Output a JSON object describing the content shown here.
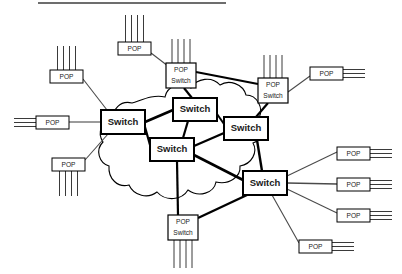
{
  "page": {
    "background_color": "#ffffff",
    "width": 402,
    "height": 274
  },
  "header_rule": {
    "name": "top-divider-rule",
    "x1": 38,
    "y1": 3,
    "x2": 226,
    "y2": 3,
    "color": "#6d6d6d"
  },
  "colors": {
    "box_fill": "#ffffff",
    "box_stroke": "#000000",
    "core_link": "#000000",
    "access_link": "#4a4a4a",
    "cloud_stroke": "#000000",
    "label_text": "#1a1a1a"
  },
  "legend_terms": {
    "switch": "Switch",
    "pop": "POP",
    "pop_switch_line1": "POP",
    "pop_switch_line2": "Switch"
  },
  "cloud": {
    "name": "network-cloud-outline",
    "d": "M 132 103 C 120 100 112 110 113 120 C 101 121 97 133 103 142 C 95 150 99 163 109 166 C 108 179 118 188 129 185 C 134 196 148 199 157 192 C 166 202 182 200 188 190 C 199 198 214 193 216 182 C 229 185 241 177 240 166 C 252 164 258 152 253 143 C 264 139 267 126 259 118 C 264 108 257 95 246 95 C 243 84 229 79 220 85 C 212 76 197 78 191 88 C 181 81 167 86 165 97 C 152 94 140 101 132 103 Z"
  },
  "nodes": [
    {
      "id": "sw-west",
      "name": "switch-west",
      "type": "switch",
      "label": "Switch",
      "x": 101,
      "y": 110,
      "w": 44,
      "h": 24,
      "stroke": 2.0,
      "font": 9.5
    },
    {
      "id": "sw-north",
      "name": "switch-north",
      "type": "switch",
      "label": "Switch",
      "x": 173,
      "y": 98,
      "w": 44,
      "h": 23,
      "stroke": 2.0,
      "font": 9.5
    },
    {
      "id": "sw-center",
      "name": "switch-center",
      "type": "switch",
      "label": "Switch",
      "x": 150,
      "y": 138,
      "w": 44,
      "h": 23,
      "stroke": 2.0,
      "font": 9.5
    },
    {
      "id": "sw-east",
      "name": "switch-east",
      "type": "switch",
      "label": "Switch",
      "x": 224,
      "y": 117,
      "w": 44,
      "h": 23,
      "stroke": 2.0,
      "font": 9.5
    },
    {
      "id": "sw-southeast",
      "name": "switch-southeast",
      "type": "switch",
      "label": "Switch",
      "x": 243,
      "y": 171,
      "w": 44,
      "h": 24,
      "stroke": 2.0,
      "font": 9.5
    },
    {
      "id": "popsw-north",
      "name": "pop-switch-north",
      "type": "popswitch",
      "label": "POP Switch",
      "x": 166,
      "y": 63,
      "w": 30,
      "h": 25,
      "stroke": 1.2,
      "font": 6.6
    },
    {
      "id": "popsw-east",
      "name": "pop-switch-east",
      "type": "popswitch",
      "label": "POP Switch",
      "x": 258,
      "y": 78,
      "w": 30,
      "h": 25,
      "stroke": 1.2,
      "font": 6.6
    },
    {
      "id": "popsw-south",
      "name": "pop-switch-south",
      "type": "popswitch",
      "label": "POP Switch",
      "x": 168,
      "y": 215,
      "w": 30,
      "h": 25,
      "stroke": 1.2,
      "font": 6.6
    },
    {
      "id": "pop-nw",
      "name": "pop-northwest",
      "type": "pop",
      "label": "POP",
      "x": 50,
      "y": 70,
      "w": 33,
      "h": 13,
      "stroke": 1.0,
      "font": 6.6
    },
    {
      "id": "pop-w",
      "name": "pop-west",
      "type": "pop",
      "label": "POP",
      "x": 36,
      "y": 116,
      "w": 33,
      "h": 13,
      "stroke": 1.0,
      "font": 6.6
    },
    {
      "id": "pop-sw",
      "name": "pop-southwest",
      "type": "pop",
      "label": "POP",
      "x": 52,
      "y": 158,
      "w": 33,
      "h": 13,
      "stroke": 1.0,
      "font": 6.6
    },
    {
      "id": "pop-n",
      "name": "pop-north",
      "type": "pop",
      "label": "POP",
      "x": 118,
      "y": 42,
      "w": 33,
      "h": 13,
      "stroke": 1.0,
      "font": 6.6
    },
    {
      "id": "pop-ne",
      "name": "pop-northeast",
      "type": "pop",
      "label": "POP",
      "x": 310,
      "y": 67,
      "w": 33,
      "h": 13,
      "stroke": 1.0,
      "font": 6.6
    },
    {
      "id": "pop-e1",
      "name": "pop-east-1",
      "type": "pop",
      "label": "POP",
      "x": 337,
      "y": 147,
      "w": 33,
      "h": 13,
      "stroke": 1.0,
      "font": 6.6
    },
    {
      "id": "pop-e2",
      "name": "pop-east-2",
      "type": "pop",
      "label": "POP",
      "x": 337,
      "y": 178,
      "w": 33,
      "h": 13,
      "stroke": 1.0,
      "font": 6.6
    },
    {
      "id": "pop-e3",
      "name": "pop-east-3",
      "type": "pop",
      "label": "POP",
      "x": 337,
      "y": 209,
      "w": 33,
      "h": 13,
      "stroke": 1.0,
      "font": 6.6
    },
    {
      "id": "pop-se",
      "name": "pop-southeast",
      "type": "pop",
      "label": "POP",
      "x": 299,
      "y": 240,
      "w": 33,
      "h": 13,
      "stroke": 1.0,
      "font": 6.6
    }
  ],
  "core_links": [
    {
      "name": "link-switch-west-to-switch-north",
      "x1": 145,
      "y1": 122,
      "x2": 173,
      "y2": 110,
      "w": 2.6
    },
    {
      "name": "link-switch-west-to-switch-center",
      "x1": 145,
      "y1": 127,
      "x2": 150,
      "y2": 145,
      "w": 2.2
    },
    {
      "name": "link-switch-north-to-popswitch-north",
      "x1": 192,
      "y1": 98,
      "x2": 184,
      "y2": 88,
      "w": 2.2
    },
    {
      "name": "link-switch-north-to-switch-center",
      "x1": 188,
      "y1": 121,
      "x2": 183,
      "y2": 138,
      "w": 2.2
    },
    {
      "name": "link-switch-north-to-switch-east",
      "x1": 217,
      "y1": 114,
      "x2": 224,
      "y2": 124,
      "w": 2.0
    },
    {
      "name": "link-switch-center-to-switch-east",
      "x1": 194,
      "y1": 146,
      "x2": 224,
      "y2": 133,
      "w": 2.4
    },
    {
      "name": "link-switch-center-to-switch-southeast",
      "x1": 194,
      "y1": 155,
      "x2": 243,
      "y2": 180,
      "w": 2.6
    },
    {
      "name": "link-switch-center-to-popswitch-south",
      "x1": 177,
      "y1": 161,
      "x2": 178,
      "y2": 215,
      "w": 2.2
    },
    {
      "name": "link-switch-east-to-switch-southeast",
      "x1": 257,
      "y1": 140,
      "x2": 262,
      "y2": 171,
      "w": 2.4
    },
    {
      "name": "link-switch-east-to-popswitch-east",
      "x1": 256,
      "y1": 117,
      "x2": 268,
      "y2": 103,
      "w": 2.2
    },
    {
      "name": "link-popswitch-north-to-popswitch-east",
      "x1": 196,
      "y1": 72,
      "x2": 258,
      "y2": 84,
      "w": 2.2
    },
    {
      "name": "link-popswitch-south-to-switch-southeast",
      "x1": 198,
      "y1": 218,
      "x2": 247,
      "y2": 195,
      "w": 2.4
    }
  ],
  "access_links": [
    {
      "name": "link-pop-northwest-to-switch-west",
      "x1": 83,
      "y1": 79,
      "x2": 107,
      "y2": 110,
      "w": 1.1
    },
    {
      "name": "link-pop-west-to-switch-west",
      "x1": 69,
      "y1": 122,
      "x2": 101,
      "y2": 122,
      "w": 1.1
    },
    {
      "name": "link-pop-southwest-to-switch-west",
      "x1": 85,
      "y1": 160,
      "x2": 108,
      "y2": 134,
      "w": 1.1
    },
    {
      "name": "link-pop-north-to-popswitch-north",
      "x1": 151,
      "y1": 53,
      "x2": 168,
      "y2": 66,
      "w": 1.1
    },
    {
      "name": "link-pop-northeast-to-popswitch-east",
      "x1": 310,
      "y1": 76,
      "x2": 288,
      "y2": 92,
      "w": 1.1
    },
    {
      "name": "link-pop-east-1-to-switch-southeast",
      "x1": 337,
      "y1": 152,
      "x2": 287,
      "y2": 176,
      "w": 1.1
    },
    {
      "name": "link-pop-east-2-to-switch-southeast",
      "x1": 337,
      "y1": 184,
      "x2": 287,
      "y2": 183,
      "w": 1.4
    },
    {
      "name": "link-pop-east-3-to-switch-southeast",
      "x1": 337,
      "y1": 213,
      "x2": 287,
      "y2": 189,
      "w": 1.1
    },
    {
      "name": "link-pop-southeast-to-switch-southeast",
      "x1": 299,
      "y1": 243,
      "x2": 272,
      "y2": 195,
      "w": 1.1
    }
  ],
  "tails": [
    {
      "name": "tails-pop-north-up",
      "node": "pop-n",
      "dir": "up",
      "count": 4,
      "len": 27,
      "spacing": 6
    },
    {
      "name": "tails-pop-northwest-up",
      "node": "pop-nw",
      "dir": "up",
      "count": 4,
      "len": 24,
      "spacing": 6
    },
    {
      "name": "tails-pop-west-left",
      "node": "pop-w",
      "dir": "left",
      "count": 3,
      "len": 22,
      "spacing": 4
    },
    {
      "name": "tails-pop-southwest-down",
      "node": "pop-sw",
      "dir": "down",
      "count": 4,
      "len": 25,
      "spacing": 6
    },
    {
      "name": "tails-popswitch-north-up",
      "node": "popsw-north",
      "dir": "up",
      "count": 4,
      "len": 24,
      "spacing": 6
    },
    {
      "name": "tails-popswitch-east-up",
      "node": "popsw-east",
      "dir": "up",
      "count": 4,
      "len": 23,
      "spacing": 6
    },
    {
      "name": "tails-popswitch-south-down",
      "node": "popsw-south",
      "dir": "down",
      "count": 4,
      "len": 28,
      "spacing": 6
    },
    {
      "name": "tails-pop-northeast-right",
      "node": "pop-ne",
      "dir": "right",
      "count": 3,
      "len": 22,
      "spacing": 4
    },
    {
      "name": "tails-pop-east-1-right",
      "node": "pop-e1",
      "dir": "right",
      "count": 3,
      "len": 22,
      "spacing": 4
    },
    {
      "name": "tails-pop-east-2-right",
      "node": "pop-e2",
      "dir": "right",
      "count": 3,
      "len": 22,
      "spacing": 4
    },
    {
      "name": "tails-pop-east-3-right",
      "node": "pop-e3",
      "dir": "right",
      "count": 3,
      "len": 22,
      "spacing": 4
    },
    {
      "name": "tails-pop-southeast-right",
      "node": "pop-se",
      "dir": "right",
      "count": 3,
      "len": 22,
      "spacing": 4
    }
  ],
  "summary": {
    "switch_count": 5,
    "pop_switch_count": 3,
    "pop_count": 9
  }
}
